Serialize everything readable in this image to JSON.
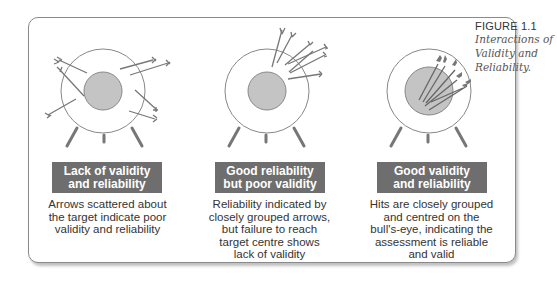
{
  "caption": {
    "figure_number": "FIGURE 1.1",
    "title_lines": [
      "Interactions of",
      "Validity and",
      "Reliability."
    ]
  },
  "panels": [
    {
      "id": "scattered",
      "label_lines": [
        "Lack of validity",
        "and reliability"
      ],
      "description_lines": [
        "Arrows scattered about",
        "the target indicate poor",
        "validity and reliability"
      ]
    },
    {
      "id": "grouped-off-centre",
      "label_lines": [
        "Good reliability",
        "but poor validity"
      ],
      "description_lines": [
        "Reliability indicated by",
        "closely grouped arrows,",
        "but failure to reach",
        "target centre shows",
        "lack of validity"
      ]
    },
    {
      "id": "grouped-centre",
      "label_lines": [
        "Good validity",
        "and reliability"
      ],
      "description_lines": [
        "Hits are closely grouped",
        "and centred on the",
        "bull's-eye, indicating the",
        "assessment is reliable",
        "and valid"
      ]
    }
  ],
  "colors": {
    "label_bg": "#6e6e6e",
    "bullseye_fill": "#c4c4c4",
    "arrow": "#777777",
    "frame_border": "#8a8a8a"
  }
}
